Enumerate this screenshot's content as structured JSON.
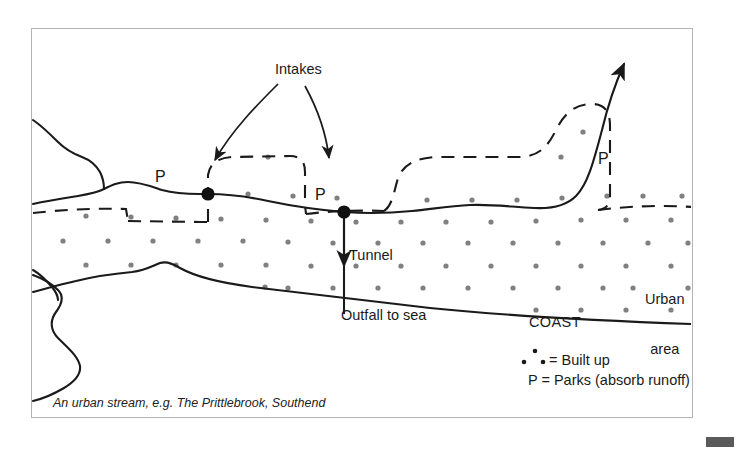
{
  "figure": {
    "caption": "An urban stream, e.g. The Prittlebrook, Southend",
    "labels": {
      "intakes": "Intakes",
      "park_left": "P",
      "park_middle": "P",
      "park_right": "P",
      "tunnel": "Tunnel",
      "outfall": "Outfall to sea",
      "coast": "COAST",
      "urban_area_line1": "Urban",
      "urban_area_line2": "area"
    },
    "legend": {
      "built_up": "= Built up",
      "parks": "P = Parks (absorb runoff)"
    },
    "colors": {
      "ink": "#1a1a1a",
      "dot": "#808080",
      "frame": "#b4b4b4",
      "corner_mark": "#5a5a5a"
    }
  },
  "diagram_data": {
    "type": "schematic-map",
    "subject": "Urban stream catchment with flood-relief tunnel",
    "features": [
      {
        "name": "stream-channel",
        "style": "solid-line",
        "direction": "flows left (seaward) from upper-right tributary arrow"
      },
      {
        "name": "built-up-boundary",
        "style": "dashed-line",
        "meaning": "edge of built up area"
      },
      {
        "name": "coastline",
        "style": "solid-line",
        "label": "COAST"
      },
      {
        "name": "intake-1",
        "style": "filled-circle",
        "x": 208,
        "y": 194
      },
      {
        "name": "intake-2",
        "style": "filled-circle",
        "x": 344,
        "y": 212
      },
      {
        "name": "tunnel",
        "style": "vertical-arrow",
        "from_y": 214,
        "to_y": 316,
        "label": "Tunnel"
      },
      {
        "name": "built-up-fill",
        "style": "stippled-dot-grid",
        "meaning": "Built up"
      }
    ],
    "park_markers": 3
  }
}
